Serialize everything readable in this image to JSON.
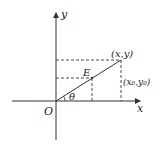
{
  "diagram": {
    "title": "",
    "colors": {
      "stroke": "#333333",
      "text": "#222222",
      "background": "#ffffff"
    },
    "axes": {
      "x_label": "x",
      "y_label": "y",
      "origin_label": "O"
    },
    "points": {
      "outer": {
        "label": "(x,y)"
      },
      "inner": {
        "label": "E"
      },
      "inner_coords": {
        "label": "(x₀,y₀)"
      }
    },
    "angle": {
      "label": "θ"
    }
  }
}
